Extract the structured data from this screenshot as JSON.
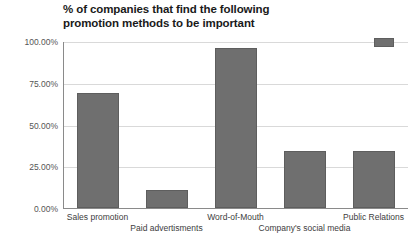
{
  "chart_data": {
    "type": "bar",
    "title": "% of companies that find the following promotion methods to be important",
    "title_line1": "% of companies that find the following",
    "title_line2": "promotion methods to be important",
    "xlabel": "",
    "ylabel": "",
    "categories": [
      "Sales promotion",
      "Paid advertisments",
      "Word-of-Mouth",
      "Company's social media",
      "Public Relations"
    ],
    "values": [
      69,
      11,
      96,
      34,
      34
    ],
    "ylim": [
      0,
      100
    ],
    "yticks": [
      0,
      25,
      50,
      75,
      100
    ],
    "ytick_labels": [
      "0.00%",
      "25.00%",
      "50.00%",
      "75.00%",
      "100.00%"
    ],
    "grid": true,
    "legend_position": "top-right",
    "legend_entries": [
      ""
    ],
    "series_color": "#6f6f6f",
    "grid_color": "#d9d9d9",
    "axis_color": "#8a8a8a"
  },
  "legend": {
    "label": ""
  }
}
